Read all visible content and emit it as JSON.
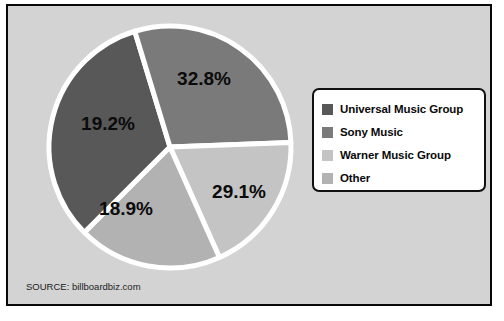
{
  "figure": {
    "background_color": "#d3d3d3",
    "border_color": "#080808",
    "source_note": "SOURCE: billboardbiz.com"
  },
  "legend": {
    "position": "right",
    "background_color": "#ffffff",
    "border_color": "#101010",
    "entries": [
      {
        "label": "Universal Music Group",
        "color": "#585858"
      },
      {
        "label": "Sony Music",
        "color": "#7a7a7a"
      },
      {
        "label": "Warner Music Group",
        "color": "#c4c4c4"
      },
      {
        "label": "Other",
        "color": "#b2b2b2"
      }
    ]
  },
  "chart_data": {
    "type": "pie",
    "title": "",
    "categories": [
      "Universal Music Group",
      "Sony Music",
      "Warner Music Group",
      "Other"
    ],
    "values": [
      32.8,
      29.1,
      18.9,
      19.2
    ],
    "value_labels": [
      "32.8%",
      "29.1%",
      "18.9%",
      "19.2%"
    ],
    "colors": [
      "#585858",
      "#7a7a7a",
      "#c4c4c4",
      "#b2b2b2"
    ],
    "units": "percent",
    "slice_edge_color": "#ffffff",
    "slice_edge_width": 5,
    "start_angle_deg": 135,
    "direction": "clockwise",
    "legend_position": "right",
    "grid": false,
    "source": "billboardbiz.com",
    "label_color": "#0b0b0b",
    "slices": [
      {
        "name": "Universal Music Group",
        "value": 32.8,
        "label": "32.8%",
        "color": "#585858",
        "label_x": 196,
        "label_y": 79
      },
      {
        "name": "Sony Music",
        "value": 29.1,
        "label": "29.1%",
        "color": "#7a7a7a",
        "label_x": 231,
        "label_y": 192
      },
      {
        "name": "Warner Music Group",
        "value": 18.9,
        "label": "18.9%",
        "color": "#c4c4c4",
        "label_x": 118,
        "label_y": 209
      },
      {
        "name": "Other",
        "value": 19.2,
        "label": "19.2%",
        "color": "#b2b2b2",
        "label_x": 100,
        "label_y": 124
      }
    ]
  }
}
